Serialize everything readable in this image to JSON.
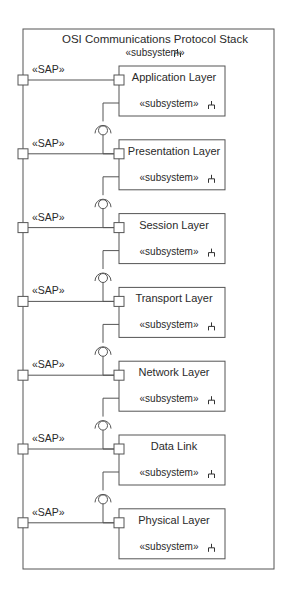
{
  "diagram": {
    "title": "OSI Communications Protocol Stack",
    "stereotype": "«subsystem»",
    "stereotype_icon": "subsystem-fork-icon",
    "port_label": "«SAP»",
    "colors": {
      "line": "#555555",
      "text": "#2a2a2a",
      "background": "#ffffff"
    },
    "layers": [
      {
        "name": "Application Layer",
        "stereotype": "«subsystem»"
      },
      {
        "name": "Presentation Layer",
        "stereotype": "«subsystem»"
      },
      {
        "name": "Session Layer",
        "stereotype": "«subsystem»"
      },
      {
        "name": "Transport Layer",
        "stereotype": "«subsystem»"
      },
      {
        "name": "Network Layer",
        "stereotype": "«subsystem»"
      },
      {
        "name": "Data Link",
        "stereotype": "«subsystem»"
      },
      {
        "name": "Physical Layer",
        "stereotype": "«subsystem»"
      }
    ],
    "connectors": [
      {
        "from": "Application Layer",
        "to": "Presentation Layer",
        "type": "ball-and-socket"
      },
      {
        "from": "Presentation Layer",
        "to": "Session Layer",
        "type": "ball-and-socket"
      },
      {
        "from": "Session Layer",
        "to": "Transport Layer",
        "type": "ball-and-socket"
      },
      {
        "from": "Transport Layer",
        "to": "Network Layer",
        "type": "ball-and-socket"
      },
      {
        "from": "Network Layer",
        "to": "Data Link",
        "type": "ball-and-socket"
      },
      {
        "from": "Data Link",
        "to": "Physical Layer",
        "type": "ball-and-socket"
      }
    ]
  }
}
